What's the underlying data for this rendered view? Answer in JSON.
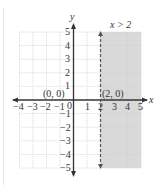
{
  "graph": {
    "inequality_label": "x > 2",
    "x_axis_label": "x",
    "y_axis_label": "y",
    "x_ticks": [
      "−4",
      "−3",
      "−2",
      "−1",
      "0",
      "1",
      "2",
      "3",
      "4",
      "5"
    ],
    "y_ticks_pos": [
      "1",
      "2",
      "3",
      "4",
      "5"
    ],
    "y_ticks_neg": [
      "−1",
      "−2",
      "−3",
      "−4",
      "−5"
    ],
    "point_origin": "(0, 0)",
    "point_boundary": "(2, 0)",
    "shade_color": "#d9d9d9",
    "grid_color": "#cfcfcf",
    "axis_color": "#333333",
    "boundary_color": "#555555"
  }
}
